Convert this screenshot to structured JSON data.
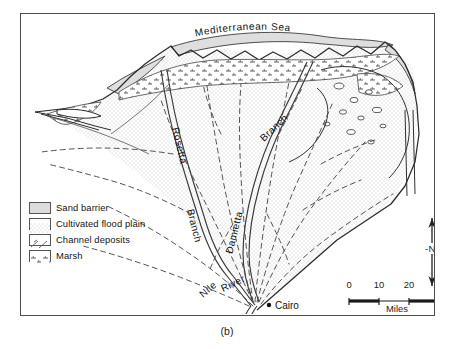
{
  "figure": {
    "caption": "(b)",
    "title_on_map": "Mediterranean Sea"
  },
  "map": {
    "sea_label": "Mediterranean Sea",
    "labels": [
      {
        "name": "rosetta-branch",
        "text": "Rosetta Branch"
      },
      {
        "name": "damietta-branch",
        "text": "Damietta"
      },
      {
        "name": "branch-label",
        "text": "Branch"
      },
      {
        "name": "nile-river",
        "text": "Nile River"
      },
      {
        "name": "cairo",
        "text": "Cairo"
      }
    ],
    "rosetta_label": "Rosetta",
    "rosetta_branch_word": "Branch",
    "damietta_label": "Damietta",
    "damietta_branch_word": "Branch",
    "nile_label": "Nile",
    "river_label": "River",
    "city_label": "Cairo"
  },
  "legend": {
    "items": [
      {
        "label": "Sand barrier",
        "pattern": "solid-gray",
        "color": "#dcdcdc"
      },
      {
        "label": "Cultivated flood plain",
        "pattern": "fine-dots",
        "color": "#8a8a8a"
      },
      {
        "label": "Channel deposits",
        "pattern": "dashed-lines",
        "color": "#6a6a6a"
      },
      {
        "label": "Marsh",
        "pattern": "marsh-hatch",
        "color": "#555555"
      }
    ]
  },
  "north_arrow": {
    "label": "-N-"
  },
  "scale": {
    "ticks": [
      "0",
      "10",
      "20",
      "30"
    ],
    "unit": "Miles",
    "max": 30
  },
  "colors": {
    "frame": "#4d4d4d",
    "ink": "#2b2b2b",
    "sand": "#dcdcdc",
    "floodplain_dot": "#9a9a9a",
    "water": "#ffffff"
  }
}
